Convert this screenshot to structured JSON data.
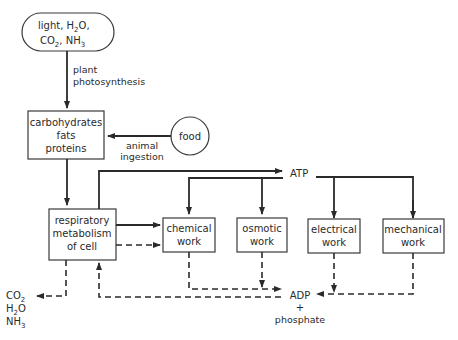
{
  "diagram": {
    "nodes": {
      "inputs": {
        "line1_a": "light, H",
        "line1_sub": "2",
        "line1_b": "O,",
        "line2_a": "CO",
        "line2_sub": "2",
        "line2_b": ", NH",
        "line2_sub2": "3"
      },
      "nutrients": {
        "line1": "carbohydrates",
        "line2": "fats",
        "line3": "proteins"
      },
      "food": {
        "label": "food"
      },
      "respiration": {
        "line1": "respiratory",
        "line2": "metabolism",
        "line3": "of cell"
      },
      "chemical": {
        "line1": "chemical",
        "line2": "work"
      },
      "osmotic": {
        "line1": "osmotic",
        "line2": "work"
      },
      "electrical": {
        "line1": "electrical",
        "line2": "work"
      },
      "mechanical": {
        "line1": "mechanical",
        "line2": "work"
      },
      "atp": {
        "label": "ATP"
      },
      "adp": {
        "label": "ADP",
        "plus": "+",
        "phosphate": "phosphate"
      },
      "wastes": {
        "co2_a": "CO",
        "co2_sub": "2",
        "h2o_a": "H",
        "h2o_sub": "2",
        "h2o_b": "O",
        "nh3_a": "NH",
        "nh3_sub": "3"
      }
    },
    "edge_labels": {
      "photosynthesis_1": "plant",
      "photosynthesis_2": "photosynthesis",
      "ingestion_1": "animal",
      "ingestion_2": "ingestion"
    },
    "legend": {
      "solid": "energy-rich flow",
      "dashed": "energy-depleted flow"
    },
    "colors": {
      "stroke": "#2a2a2a",
      "background": "#ffffff"
    }
  }
}
